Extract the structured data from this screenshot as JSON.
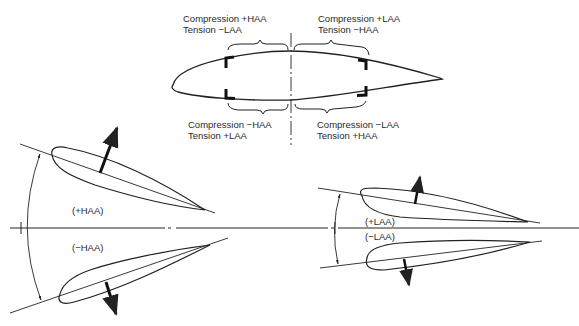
{
  "top_section": {
    "upper_left": {
      "line1": "Compression +HAA",
      "line2": "Tension −LAA"
    },
    "upper_right": {
      "line1": "Compression +LAA",
      "line2": "Tension −HAA"
    },
    "lower_left": {
      "line1": "Compression −HAA",
      "line2": "Tension +LAA"
    },
    "lower_right": {
      "line1": "Compression −LAA",
      "line2": "Tension +HAA"
    }
  },
  "left_section": {
    "upper_label": "(+HAA)",
    "lower_label": "(−HAA)"
  },
  "right_section": {
    "upper_label": "(+LAA)",
    "lower_label": "(−LAA)"
  },
  "colors": {
    "line": "#222222",
    "background": "#ffffff"
  }
}
